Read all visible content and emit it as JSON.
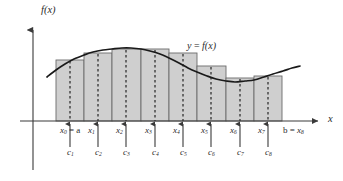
{
  "figure": {
    "kind": "riemann-sum-midpoint-diagram",
    "background_color": "#ffffff",
    "axis_color": "#3a3a3a",
    "curve_color": "#1a1a1a",
    "rect_fill": "#cfcfcf",
    "rect_stroke": "#6b6b6b",
    "dashed_color": "#2b2b2b",
    "text_color": "#2b2b2b"
  },
  "axes": {
    "y_axis_label": "f(x)",
    "x_axis_label": "x",
    "origin_x": 33,
    "baseline_y": 121,
    "y_axis_top": 22,
    "y_axis_bottom": 170,
    "x_axis_right": 325
  },
  "curve": {
    "label_y": "y",
    "label_equals": "=",
    "label_f": "f(x)",
    "label_full": "y = f(x)"
  },
  "x_ticks": [
    {
      "id": "x0",
      "label_base": "x",
      "label_sub": "0",
      "suffix": " = a",
      "display": "x0 = a",
      "x": 56
    },
    {
      "id": "x1",
      "label_base": "x",
      "label_sub": "1",
      "suffix": "",
      "display": "x1",
      "x": 84
    },
    {
      "id": "x2",
      "label_base": "x",
      "label_sub": "2",
      "suffix": "",
      "display": "x2",
      "x": 112
    },
    {
      "id": "x3",
      "label_base": "x",
      "label_sub": "3",
      "suffix": "",
      "display": "x3",
      "x": 141
    },
    {
      "id": "x4",
      "label_base": "x",
      "label_sub": "4",
      "suffix": "",
      "display": "x4",
      "x": 169
    },
    {
      "id": "x5",
      "label_base": "x",
      "label_sub": "5",
      "suffix": "",
      "display": "x5",
      "x": 197
    },
    {
      "id": "x6",
      "label_base": "x",
      "label_sub": "6",
      "suffix": "",
      "display": "x6",
      "x": 226
    },
    {
      "id": "x7",
      "label_base": "x",
      "label_sub": "7",
      "suffix": "",
      "display": "x7",
      "x": 254
    },
    {
      "id": "x8",
      "label_base": "x",
      "label_sub": "8",
      "prefix": "b = ",
      "display": "b = x8",
      "x": 282
    }
  ],
  "c_ticks": [
    {
      "id": "c1",
      "label_base": "c",
      "label_sub": "1",
      "x": 70
    },
    {
      "id": "c2",
      "label_base": "c",
      "label_sub": "2",
      "x": 98
    },
    {
      "id": "c3",
      "label_base": "c",
      "label_sub": "3",
      "x": 126
    },
    {
      "id": "c4",
      "label_base": "c",
      "label_sub": "4",
      "x": 155
    },
    {
      "id": "c5",
      "label_base": "c",
      "label_sub": "5",
      "x": 183
    },
    {
      "id": "c6",
      "label_base": "c",
      "label_sub": "6",
      "x": 211
    },
    {
      "id": "c7",
      "label_base": "c",
      "label_sub": "7",
      "x": 240
    },
    {
      "id": "c8",
      "label_base": "c",
      "label_sub": "8",
      "x": 268
    }
  ],
  "chart_data": {
    "type": "bar",
    "title": "",
    "xlabel": "x",
    "ylabel": "f(x)",
    "categories": [
      "c1",
      "c2",
      "c3",
      "c4",
      "c5",
      "c6",
      "c7",
      "c8"
    ],
    "bar_left_edges_px": [
      56,
      84,
      112,
      141,
      169,
      197,
      226,
      254
    ],
    "bar_right_edges_px": [
      84,
      112,
      141,
      169,
      197,
      226,
      254,
      282
    ],
    "bar_top_y_px": [
      60,
      53,
      49,
      49,
      53,
      66,
      78,
      76
    ],
    "baseline_y_px": 121,
    "values": [
      61,
      68,
      72,
      72,
      68,
      55,
      43,
      45
    ],
    "ylim": [
      0,
      99
    ],
    "grid": false,
    "legend": null,
    "series": [
      {
        "name": "y = f(x)",
        "type": "line",
        "points_px": [
          [
            47,
            77
          ],
          [
            56,
            70
          ],
          [
            65,
            64
          ],
          [
            74,
            59
          ],
          [
            84,
            55
          ],
          [
            93,
            52
          ],
          [
            103,
            50
          ],
          [
            112,
            49
          ],
          [
            122,
            48
          ],
          [
            131,
            48
          ],
          [
            141,
            49
          ],
          [
            150,
            51
          ],
          [
            160,
            54
          ],
          [
            169,
            58
          ],
          [
            179,
            63
          ],
          [
            188,
            68
          ],
          [
            197,
            72
          ],
          [
            207,
            76
          ],
          [
            216,
            79
          ],
          [
            226,
            81
          ],
          [
            235,
            82
          ],
          [
            245,
            81
          ],
          [
            254,
            80
          ],
          [
            264,
            77
          ],
          [
            273,
            74
          ],
          [
            283,
            71
          ],
          [
            292,
            68
          ],
          [
            300,
            66
          ]
        ]
      }
    ]
  }
}
